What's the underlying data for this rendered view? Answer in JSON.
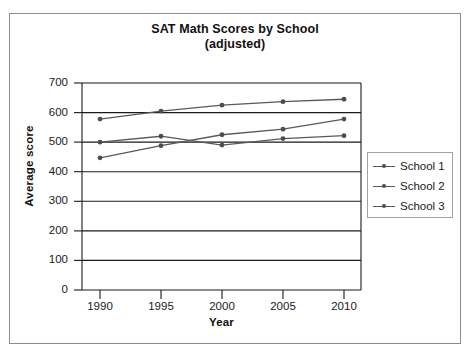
{
  "chart_data": {
    "type": "line",
    "title": "SAT Math Scores by School",
    "subtitle": "(adjusted)",
    "xlabel": "Year",
    "ylabel": "Average score",
    "categories": [
      "1990",
      "1995",
      "2000",
      "2005",
      "2010"
    ],
    "x": [
      1990,
      1995,
      2000,
      2005,
      2010
    ],
    "series": [
      {
        "name": "School 1",
        "values": [
          500,
          520,
          490,
          512,
          522
        ]
      },
      {
        "name": "School 2",
        "values": [
          578,
          605,
          625,
          637,
          645
        ]
      },
      {
        "name": "School 3",
        "values": [
          447,
          488,
          525,
          544,
          578
        ]
      }
    ],
    "ylim": [
      0,
      700
    ],
    "yticks": [
      "0",
      "100",
      "200",
      "300",
      "400",
      "500",
      "600",
      "700"
    ],
    "ytick_values": [
      0,
      100,
      200,
      300,
      400,
      500,
      600,
      700
    ],
    "xticks": [
      "1990",
      "1995",
      "2000",
      "2005",
      "2010"
    ],
    "grid": "horizontal",
    "legend_position": "right",
    "line_color": "#595959",
    "marker_color": "#4d4d4d",
    "axis_color": "#1a1a1a",
    "frame_color": "#8c8c8c"
  },
  "legend": {
    "entries": [
      {
        "label": "School 1"
      },
      {
        "label": "School 2"
      },
      {
        "label": "School 3"
      }
    ]
  }
}
